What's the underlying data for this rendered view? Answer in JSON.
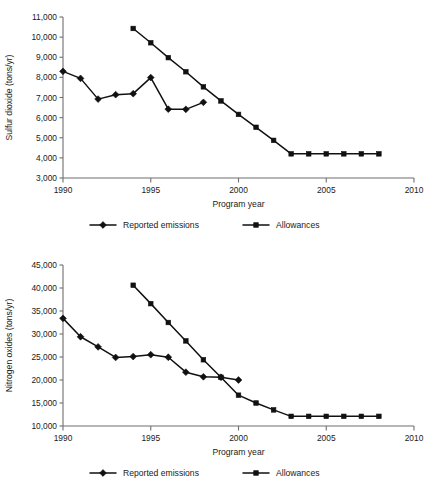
{
  "page": {
    "background": "#ffffff",
    "ink_color": "#111111",
    "axis_color": "#6e6e6e"
  },
  "chart_data": [
    {
      "id": "sulfur-dioxide",
      "type": "line",
      "title": "",
      "xlabel": "Program year",
      "ylabel": "Sulfur dioxide (tons/yr)",
      "xlim": [
        1990,
        2010
      ],
      "ylim": [
        3000,
        11000
      ],
      "xticks": [
        1990,
        1995,
        2000,
        2005,
        2010
      ],
      "xtick_labels": [
        "1990",
        "1995",
        "2000",
        "2005",
        "2010"
      ],
      "yticks": [
        3000,
        4000,
        5000,
        6000,
        7000,
        8000,
        9000,
        10000,
        11000
      ],
      "ytick_labels": [
        "3,000",
        "4,000",
        "5,000",
        "6,000",
        "7,000",
        "8,000",
        "9,000",
        "10,000",
        "11,000"
      ],
      "grid": false,
      "legend_position": "bottom",
      "series": [
        {
          "name": "Reported emissions",
          "marker": "diamond",
          "x": [
            1990,
            1991,
            1992,
            1993,
            1994,
            1995,
            1996,
            1997,
            1998
          ],
          "values": [
            8300,
            7950,
            6920,
            7140,
            7190,
            7990,
            6420,
            6410,
            6760
          ]
        },
        {
          "name": "Allowances",
          "marker": "square",
          "x": [
            1994,
            1995,
            1996,
            1997,
            1998,
            1999,
            2000,
            2001,
            2002,
            2003,
            2004,
            2005,
            2006,
            2007,
            2008
          ],
          "values": [
            10430,
            9720,
            8980,
            8280,
            7530,
            6830,
            6160,
            5520,
            4870,
            4200,
            4200,
            4200,
            4200,
            4200,
            4200
          ]
        }
      ]
    },
    {
      "id": "nitrogen-oxides",
      "type": "line",
      "title": "",
      "xlabel": "Program year",
      "ylabel": "Nitrogen oxides (tons/yr)",
      "xlim": [
        1990,
        2010
      ],
      "ylim": [
        10000,
        45000
      ],
      "xticks": [
        1990,
        1995,
        2000,
        2005,
        2010
      ],
      "xtick_labels": [
        "1990",
        "1995",
        "2000",
        "2005",
        "2010"
      ],
      "yticks": [
        10000,
        15000,
        20000,
        25000,
        30000,
        35000,
        40000,
        45000
      ],
      "ytick_labels": [
        "10,000",
        "15,000",
        "20,000",
        "25,000",
        "30,000",
        "35,000",
        "40,000",
        "45,000"
      ],
      "grid": false,
      "legend_position": "bottom",
      "series": [
        {
          "name": "Reported emissions",
          "marker": "diamond",
          "x": [
            1990,
            1991,
            1992,
            1993,
            1994,
            1995,
            1996,
            1997,
            1998,
            1999,
            2000
          ],
          "values": [
            33400,
            29400,
            27200,
            24900,
            25100,
            25500,
            24950,
            21700,
            20700,
            20600,
            20000
          ]
        },
        {
          "name": "Allowances",
          "marker": "square",
          "x": [
            1994,
            1995,
            1996,
            1997,
            1998,
            1999,
            2000,
            2001,
            2002,
            2003,
            2004,
            2005,
            2006,
            2007,
            2008
          ],
          "values": [
            40600,
            36600,
            32500,
            28500,
            24400,
            20600,
            16700,
            15000,
            13500,
            12100,
            12100,
            12100,
            12100,
            12100,
            12100
          ]
        }
      ]
    }
  ]
}
